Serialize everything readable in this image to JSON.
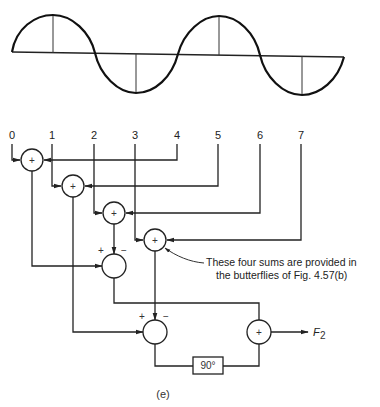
{
  "figure": {
    "caption": "(e)",
    "sample_labels": [
      "0",
      "1",
      "2",
      "3",
      "4",
      "5",
      "6",
      "7"
    ],
    "sum_symbol": "+",
    "minus_symbol": "−",
    "plus_sign": "+",
    "phase_box": "90°",
    "output_label": "F",
    "output_subscript": "2",
    "note_line1": "These four sums are provided in",
    "note_line2": "the butterflies of Fig. 4.57(b)",
    "waveform": "sine, two cycles over 8 samples"
  }
}
